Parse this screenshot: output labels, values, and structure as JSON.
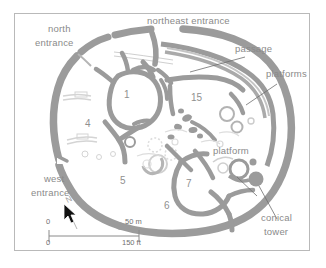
{
  "map": {
    "title_alt": "Great Zimbabwe Great Enclosure site plan",
    "colors": {
      "wall": "#9b9b9b",
      "wall_light": "#c9c9c9",
      "ruin_faint": "#d8d8d8",
      "label_text": "#8a8a8a",
      "frame_border": "#b9b9b9",
      "background": "#ffffff",
      "cursor": "#111111"
    },
    "labels": [
      {
        "id": "north-entrance-line1",
        "text": "north",
        "x": 47,
        "y": 28
      },
      {
        "id": "north-entrance-line2",
        "text": "entrance",
        "x": 34,
        "y": 42
      },
      {
        "id": "northeast-entrance",
        "text": "northeast entrance",
        "x": 146,
        "y": 18
      },
      {
        "id": "passage",
        "text": "passage",
        "x": 234,
        "y": 43
      },
      {
        "id": "platforms",
        "text": "platforms",
        "x": 265,
        "y": 68
      },
      {
        "id": "platform",
        "text": "platform",
        "x": 212,
        "y": 145
      },
      {
        "id": "west-entrance-line1",
        "text": "west",
        "x": 43,
        "y": 173
      },
      {
        "id": "west-entrance-line2",
        "text": "entrance",
        "x": 30,
        "y": 187
      },
      {
        "id": "conical-tower-line1",
        "text": "conical",
        "x": 260,
        "y": 212
      },
      {
        "id": "conical-tower-line2",
        "text": "tower",
        "x": 263,
        "y": 226
      }
    ],
    "enclosure_numbers": [
      {
        "id": "enclosure-1",
        "text": "1",
        "x": 123,
        "y": 89
      },
      {
        "id": "enclosure-15",
        "text": "15",
        "x": 190,
        "y": 92
      },
      {
        "id": "enclosure-4",
        "text": "4",
        "x": 84,
        "y": 118
      },
      {
        "id": "enclosure-5",
        "text": "5",
        "x": 119,
        "y": 175
      },
      {
        "id": "enclosure-7",
        "text": "7",
        "x": 185,
        "y": 178
      },
      {
        "id": "enclosure-6",
        "text": "6",
        "x": 163,
        "y": 200
      }
    ],
    "north_arrow": {
      "letter": "N",
      "x": 66,
      "y": 200
    },
    "scale_bar": {
      "metric_zero": "0",
      "metric_max": "50 m",
      "imperial_zero": "0",
      "imperial_max": "150 ft",
      "x": 48,
      "y": 228,
      "width": 90
    }
  }
}
